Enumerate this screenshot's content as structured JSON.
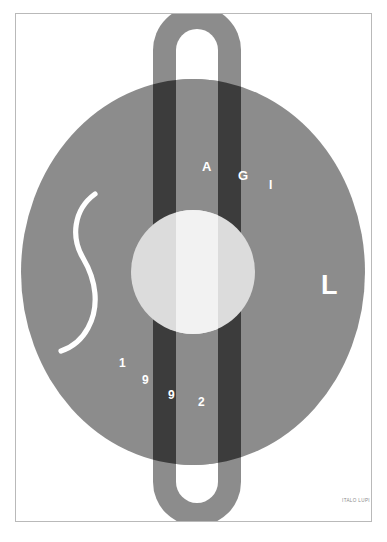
{
  "poster": {
    "title": "AGI 1992",
    "organization_initials": [
      "A",
      "G",
      "I"
    ],
    "large_letter": "L",
    "year_digits": [
      "1",
      "9",
      "9",
      "2"
    ],
    "credit": "ITALO LUPI",
    "colors": {
      "background": "#ffffff",
      "frame_border": "#b9b9b9",
      "mid_gray": "#8c8c8c",
      "dark_gray": "#3c3c3c",
      "light_circle": "#dcdcdc",
      "white": "#ffffff",
      "credit_text": "#8a8a8a"
    },
    "shapes": {
      "ellipse_label": "large-gray-ellipse",
      "pill_label": "vertical-rounded-pill",
      "inner_circle_label": "light-center-circle",
      "scurve_label": "white-s-curve"
    }
  }
}
